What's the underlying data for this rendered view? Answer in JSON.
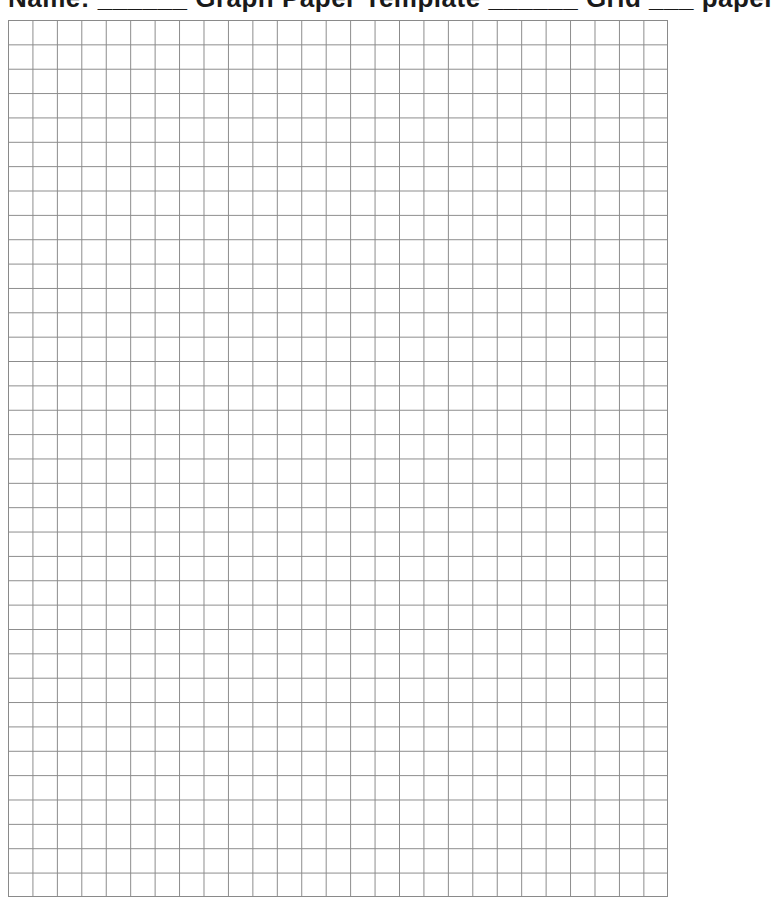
{
  "header": {
    "title": "Name: ______ Graph Paper Template ______ Grid ___ paper"
  },
  "grid": {
    "columns": 27,
    "rows": 36,
    "cell_width_px": 24.44,
    "cell_height_px": 24.36,
    "line_color": "#8a8a8a",
    "background_color": "#ffffff"
  }
}
